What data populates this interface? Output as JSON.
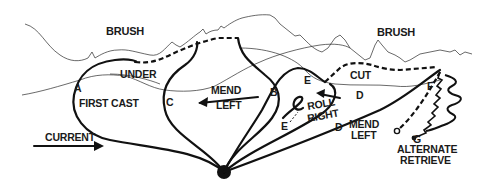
{
  "diagram": {
    "title_labels": {
      "brush_left": "BRUSH",
      "brush_right": "BRUSH"
    },
    "labels": {
      "under": "UNDER",
      "first_cast": "FIRST CAST",
      "current": "CURRENT",
      "mend_left_1_line1": "MEND",
      "mend_left_1_line2": "LEFT",
      "cut": "CUT",
      "roll_right_line1": "ROLL",
      "roll_right_line2": "RIGHT",
      "mend_left_2_line1": "MEND",
      "mend_left_2_line2": "LEFT",
      "alternate_retrieve_line1": "ALTERNATE",
      "alternate_retrieve_line2": "RETRIEVE"
    },
    "points": {
      "a": "A",
      "b": "B",
      "c": "C",
      "d_upper": "D",
      "d_lower": "D",
      "e_upper": "E",
      "e_lower": "E",
      "f": "F",
      "g": "G"
    },
    "colors": {
      "ink": "#111111",
      "background": "#ffffff"
    }
  }
}
